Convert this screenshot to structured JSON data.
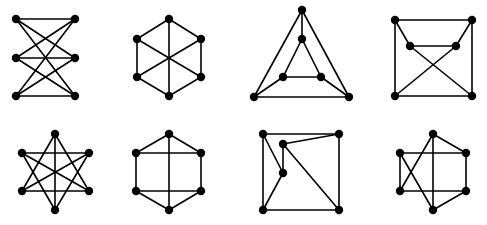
{
  "figure": {
    "width": 487,
    "height": 225,
    "background": "#ffffff",
    "edge_color": "#000000",
    "node_color": "#000000",
    "node_radius": 4.2,
    "graphs": [
      {
        "id": "graph-1-k33",
        "nodes": [
          [
            16,
            19
          ],
          [
            75,
            19
          ],
          [
            16,
            58
          ],
          [
            75,
            58
          ],
          [
            16,
            96
          ],
          [
            75,
            96
          ]
        ],
        "edges": [
          [
            0,
            1
          ],
          [
            0,
            3
          ],
          [
            0,
            5
          ],
          [
            2,
            1
          ],
          [
            2,
            3
          ],
          [
            2,
            5
          ],
          [
            4,
            1
          ],
          [
            4,
            3
          ],
          [
            4,
            5
          ]
        ]
      },
      {
        "id": "graph-2-hexagon-diagonals",
        "nodes": [
          [
            169,
            19
          ],
          [
            137,
            39
          ],
          [
            201,
            39
          ],
          [
            137,
            77
          ],
          [
            201,
            77
          ],
          [
            169,
            96
          ]
        ],
        "edges": [
          [
            0,
            1
          ],
          [
            0,
            2
          ],
          [
            1,
            3
          ],
          [
            2,
            4
          ],
          [
            3,
            5
          ],
          [
            4,
            5
          ],
          [
            0,
            5
          ],
          [
            1,
            4
          ],
          [
            2,
            3
          ]
        ]
      },
      {
        "id": "graph-3-prism-triangles",
        "nodes": [
          [
            302,
            10
          ],
          [
            254,
            97
          ],
          [
            349,
            97
          ],
          [
            302,
            39
          ],
          [
            283,
            77
          ],
          [
            321,
            77
          ]
        ],
        "edges": [
          [
            0,
            1
          ],
          [
            0,
            2
          ],
          [
            1,
            2
          ],
          [
            3,
            4
          ],
          [
            3,
            5
          ],
          [
            4,
            5
          ],
          [
            0,
            3
          ],
          [
            1,
            4
          ],
          [
            2,
            5
          ]
        ]
      },
      {
        "id": "graph-4-square-crossed",
        "nodes": [
          [
            395,
            20
          ],
          [
            472,
            20
          ],
          [
            395,
            96
          ],
          [
            472,
            96
          ],
          [
            410,
            46
          ],
          [
            456,
            46
          ]
        ],
        "edges": [
          [
            0,
            1
          ],
          [
            0,
            2
          ],
          [
            1,
            3
          ],
          [
            2,
            3
          ],
          [
            0,
            4
          ],
          [
            1,
            5
          ],
          [
            4,
            5
          ],
          [
            4,
            3
          ],
          [
            5,
            2
          ]
        ]
      },
      {
        "id": "graph-5-star",
        "nodes": [
          [
            55,
            134
          ],
          [
            22,
            153
          ],
          [
            89,
            153
          ],
          [
            22,
            191
          ],
          [
            89,
            191
          ],
          [
            55,
            210
          ]
        ],
        "edges": [
          [
            0,
            3
          ],
          [
            0,
            4
          ],
          [
            0,
            5
          ],
          [
            5,
            1
          ],
          [
            5,
            2
          ],
          [
            1,
            2
          ],
          [
            3,
            4
          ],
          [
            1,
            4
          ],
          [
            2,
            3
          ]
        ]
      },
      {
        "id": "graph-6-hexagon-grid",
        "nodes": [
          [
            169,
            134
          ],
          [
            136,
            153
          ],
          [
            201,
            153
          ],
          [
            136,
            191
          ],
          [
            201,
            191
          ],
          [
            169,
            210
          ]
        ],
        "edges": [
          [
            0,
            1
          ],
          [
            0,
            2
          ],
          [
            1,
            3
          ],
          [
            2,
            4
          ],
          [
            3,
            5
          ],
          [
            4,
            5
          ],
          [
            0,
            5
          ],
          [
            1,
            2
          ],
          [
            3,
            4
          ]
        ]
      },
      {
        "id": "graph-7-square-inner",
        "nodes": [
          [
            263,
            134
          ],
          [
            339,
            134
          ],
          [
            263,
            210
          ],
          [
            339,
            210
          ],
          [
            283,
            144
          ],
          [
            283,
            173
          ]
        ],
        "edges": [
          [
            0,
            1
          ],
          [
            0,
            2
          ],
          [
            1,
            3
          ],
          [
            2,
            3
          ],
          [
            1,
            4
          ],
          [
            4,
            5
          ],
          [
            4,
            3
          ],
          [
            0,
            5
          ],
          [
            5,
            2
          ]
        ]
      },
      {
        "id": "graph-8-hexagon-crossed",
        "nodes": [
          [
            433,
            134
          ],
          [
            400,
            153
          ],
          [
            466,
            153
          ],
          [
            400,
            191
          ],
          [
            466,
            191
          ],
          [
            433,
            210
          ]
        ],
        "edges": [
          [
            0,
            2
          ],
          [
            2,
            4
          ],
          [
            4,
            5
          ],
          [
            0,
            5
          ],
          [
            1,
            2
          ],
          [
            3,
            4
          ],
          [
            1,
            3
          ],
          [
            0,
            3
          ],
          [
            1,
            5
          ]
        ]
      }
    ]
  }
}
